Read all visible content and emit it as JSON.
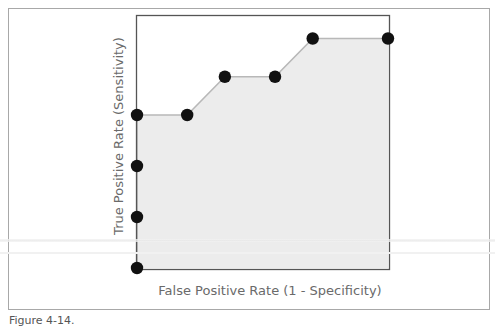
{
  "chart_data": {
    "type": "line",
    "title": "",
    "xlabel": "False Positive Rate (1 - Specificity)",
    "ylabel": "True Positive Rate (Sensitivity)",
    "xlim": [
      0,
      1
    ],
    "ylim": [
      0,
      1
    ],
    "grid": false,
    "legend": null,
    "filled_area": true,
    "series": [
      {
        "name": "ROC curve",
        "x": [
          0.0,
          0.0,
          0.0,
          0.0,
          0.2,
          0.35,
          0.55,
          0.7,
          1.0
        ],
        "y": [
          0.0,
          0.2,
          0.4,
          0.6,
          0.6,
          0.75,
          0.75,
          0.9,
          0.9
        ]
      }
    ],
    "colors": {
      "marker": "#111111",
      "line": "#b8b8b8",
      "fill": "#ececec",
      "axis": "#555555"
    }
  },
  "caption": "Figure 4-14."
}
